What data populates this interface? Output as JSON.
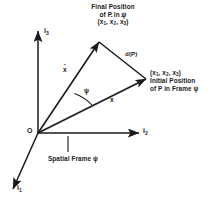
{
  "figure": {
    "ink_color": "#1a1a1a",
    "background": "#ffffff"
  },
  "axes": {
    "i1": {
      "label": "i",
      "sub": "1",
      "name": "axis-i1"
    },
    "i2": {
      "label": "i",
      "sub": "2",
      "name": "axis-i2"
    },
    "i3": {
      "label": "i",
      "sub": "3",
      "name": "axis-i3"
    },
    "origin": "O"
  },
  "labels": {
    "final_position": {
      "line1": "Final Position",
      "line2": "of P in ψ",
      "coords_open": "(",
      "coords": [
        {
          "base": "x",
          "sub": "1",
          "hat": true
        },
        {
          "base": "x",
          "sub": "2",
          "hat": true
        },
        {
          "base": "x",
          "sub": "3",
          "hat": true
        }
      ],
      "coords_close": ")",
      "separator": ", "
    },
    "initial_position": {
      "coords_open": "(",
      "coords": [
        {
          "base": "x",
          "sub": "1",
          "hat": false
        },
        {
          "base": "x",
          "sub": "2",
          "hat": false
        },
        {
          "base": "x",
          "sub": "3",
          "hat": false
        }
      ],
      "coords_close": ")",
      "separator": ", ",
      "line1": "Initial Position",
      "line2": "of P in Frame ψ"
    },
    "displacement": "d(P)",
    "vector_initial": "x",
    "vector_final": "x",
    "vector_final_hat": "ˆ",
    "angle": "ψ",
    "frame_caption": "Spatial Frame ψ"
  },
  "geometry": {
    "origin_point": [
      38,
      133
    ],
    "apex_point": [
      99,
      42
    ],
    "right_point": [
      146,
      79
    ],
    "note": "triangle O - final(apex) - initial(right)"
  }
}
